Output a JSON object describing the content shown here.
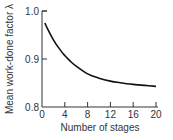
{
  "chart_data": {
    "type": "line",
    "title": "",
    "xlabel": "Number of stages",
    "ylabel": "Mean work-done factor λ",
    "xlim": [
      0,
      20
    ],
    "ylim": [
      0.8,
      1.0
    ],
    "xticks": [
      "0",
      "4",
      "8",
      "12",
      "16",
      "20"
    ],
    "yticks": [
      "0.8",
      "0.9",
      "1.0"
    ],
    "grid": false,
    "legend": null,
    "series": [
      {
        "name": "Mean work-done factor",
        "x": [
          0.5,
          1,
          2,
          3,
          4,
          5,
          6,
          8,
          10,
          12,
          14,
          16,
          18,
          20
        ],
        "values": [
          0.975,
          0.962,
          0.94,
          0.922,
          0.907,
          0.895,
          0.885,
          0.869,
          0.86,
          0.854,
          0.85,
          0.847,
          0.845,
          0.843
        ]
      }
    ]
  }
}
